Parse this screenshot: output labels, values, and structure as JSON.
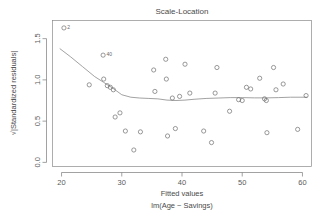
{
  "chart_data": {
    "type": "scatter",
    "title": "Scale-Location",
    "xlabel": "Fitted values",
    "sublabel": "lm(Age ~ Savings)",
    "ylabel": "√|Standardized residuals|",
    "xlim": [
      18.5,
      61.5
    ],
    "ylim": [
      -0.05,
      1.72
    ],
    "xticks": [
      20,
      30,
      40,
      50,
      60
    ],
    "xtick_labels": [
      "20",
      "30",
      "40",
      "50",
      "60"
    ],
    "yticks": [
      0.0,
      0.5,
      1.0,
      1.5
    ],
    "ytick_labels": [
      "0.0",
      "0.5",
      "1.0",
      "1.5"
    ],
    "grid": false,
    "legend": false,
    "marker": "open-circle",
    "points": [
      {
        "x": 24.6,
        "y": 0.94
      },
      {
        "x": 26.9,
        "y": 1.3
      },
      {
        "x": 27.0,
        "y": 1.01
      },
      {
        "x": 27.6,
        "y": 0.93
      },
      {
        "x": 28.1,
        "y": 0.91
      },
      {
        "x": 28.6,
        "y": 0.88
      },
      {
        "x": 28.9,
        "y": 0.55
      },
      {
        "x": 29.7,
        "y": 0.6
      },
      {
        "x": 30.6,
        "y": 0.38
      },
      {
        "x": 32.0,
        "y": 0.15
      },
      {
        "x": 33.1,
        "y": 0.37
      },
      {
        "x": 35.3,
        "y": 1.12
      },
      {
        "x": 35.5,
        "y": 0.86
      },
      {
        "x": 37.3,
        "y": 1.25
      },
      {
        "x": 37.4,
        "y": 1.01
      },
      {
        "x": 37.6,
        "y": 0.32
      },
      {
        "x": 38.4,
        "y": 0.78
      },
      {
        "x": 38.9,
        "y": 0.41
      },
      {
        "x": 39.6,
        "y": 0.8
      },
      {
        "x": 40.5,
        "y": 1.19
      },
      {
        "x": 41.3,
        "y": 0.84
      },
      {
        "x": 43.6,
        "y": 0.38
      },
      {
        "x": 44.9,
        "y": 0.24
      },
      {
        "x": 45.5,
        "y": 0.84
      },
      {
        "x": 45.8,
        "y": 1.15
      },
      {
        "x": 47.9,
        "y": 0.62
      },
      {
        "x": 49.4,
        "y": 0.76
      },
      {
        "x": 50.0,
        "y": 0.75
      },
      {
        "x": 50.7,
        "y": 0.91
      },
      {
        "x": 51.4,
        "y": 0.89
      },
      {
        "x": 52.9,
        "y": 1.02
      },
      {
        "x": 53.7,
        "y": 0.77
      },
      {
        "x": 54.0,
        "y": 0.75
      },
      {
        "x": 54.1,
        "y": 0.36
      },
      {
        "x": 55.2,
        "y": 1.15
      },
      {
        "x": 55.6,
        "y": 0.88
      },
      {
        "x": 56.8,
        "y": 0.95
      },
      {
        "x": 59.2,
        "y": 0.4
      },
      {
        "x": 60.6,
        "y": 0.81
      }
    ],
    "smoother": {
      "name": "loess",
      "x": [
        19.7,
        21.5,
        23.5,
        25.5,
        27.0,
        28.5,
        30.0,
        31.5,
        33.0,
        34.5,
        36.0,
        37.5,
        39.0,
        40.5,
        42.0,
        44.0,
        46.0,
        48.0,
        50.0,
        52.0,
        54.0,
        56.0,
        58.0,
        60.8
      ],
      "y": [
        1.38,
        1.28,
        1.16,
        1.04,
        0.97,
        0.9,
        0.82,
        0.79,
        0.78,
        0.775,
        0.77,
        0.755,
        0.75,
        0.755,
        0.765,
        0.775,
        0.78,
        0.785,
        0.785,
        0.782,
        0.782,
        0.785,
        0.79,
        0.79
      ]
    },
    "point_labels": [
      {
        "text": "2",
        "x": 20.4,
        "y": 1.63,
        "marker": true
      },
      {
        "text": "40",
        "x": 26.9,
        "y": 1.3,
        "marker": false
      }
    ]
  }
}
